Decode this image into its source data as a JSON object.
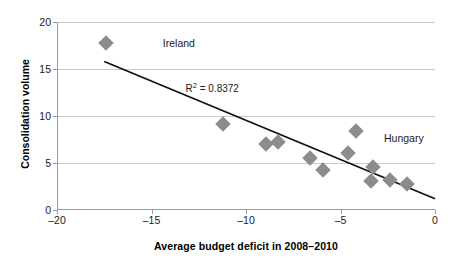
{
  "chart_data": {
    "type": "scatter",
    "title": "",
    "xlabel": "Average budget deficit in 2008–2010",
    "ylabel": "Consolidation volume",
    "xlim": [
      -20,
      0
    ],
    "ylim": [
      0,
      20
    ],
    "xticks": [
      -20,
      -15,
      -10,
      -5,
      0
    ],
    "xtick_labels": [
      "–20",
      "–15",
      "–10",
      "–5",
      "0"
    ],
    "yticks": [
      0,
      5,
      10,
      15,
      20
    ],
    "ytick_labels": [
      "0",
      "5",
      "10",
      "15",
      "20"
    ],
    "grid": "horizontal",
    "legend": "none",
    "marker": "diamond",
    "marker_color": "#8c8c8c",
    "points": [
      {
        "x": -17.4,
        "y": 17.8,
        "label": "Ireland"
      },
      {
        "x": -11.2,
        "y": 9.1,
        "label": ""
      },
      {
        "x": -8.95,
        "y": 7.0,
        "label": ""
      },
      {
        "x": -8.3,
        "y": 7.2,
        "label": ""
      },
      {
        "x": -6.6,
        "y": 5.5,
        "label": ""
      },
      {
        "x": -5.9,
        "y": 4.3,
        "label": ""
      },
      {
        "x": -4.2,
        "y": 8.4,
        "label": "Hungary"
      },
      {
        "x": -4.6,
        "y": 6.1,
        "label": ""
      },
      {
        "x": -3.3,
        "y": 4.6,
        "label": ""
      },
      {
        "x": -3.4,
        "y": 3.1,
        "label": ""
      },
      {
        "x": -2.4,
        "y": 3.2,
        "label": ""
      },
      {
        "x": -1.5,
        "y": 2.8,
        "label": ""
      }
    ],
    "trendline": {
      "x1": -17.5,
      "y1": 15.8,
      "x2": 0.0,
      "y2": 1.2,
      "color": "#111111",
      "width": 1.8
    },
    "annotations": [
      {
        "name": "ireland-label",
        "text": "Ireland",
        "x": -14.4,
        "y": 17.8
      },
      {
        "name": "hungary-label",
        "text": "Hungary",
        "x": -2.7,
        "y": 7.7
      },
      {
        "name": "r2-label",
        "text_prefix": "R",
        "text_sup": "2",
        "text_suffix": " = 0.8372",
        "x": -13.2,
        "y": 13.1
      }
    ],
    "r_squared": 0.8372,
    "r_squared_text": "R² = 0.8372"
  }
}
